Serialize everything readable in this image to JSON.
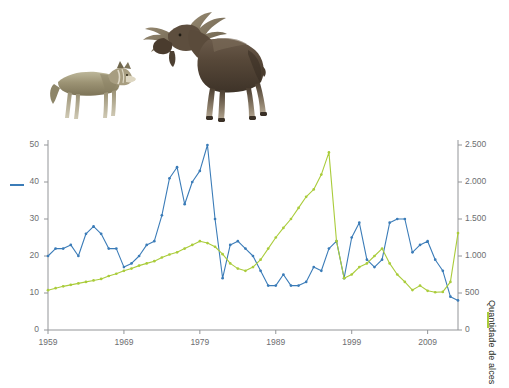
{
  "figure": {
    "wolf_label": "wolf-illustration",
    "moose_label": "moose-illustration",
    "caption": ""
  },
  "legend": {
    "wolf_marker": "blue-line-swatch",
    "moose_marker": "green-line-swatch"
  },
  "colors": {
    "wolf_line": "#3b7cb8",
    "moose_line": "#aacc3b",
    "axis": "#939598",
    "tick_text": "#6d6e71",
    "title_text": "#231f20"
  },
  "chart_data": {
    "type": "line",
    "title": "",
    "subtitle": "",
    "xlabel": "",
    "ylabel": "Quantidade de lobos",
    "y2label": "Quantidade de alces",
    "grid": false,
    "legend_position": "axis-titles",
    "xlim": [
      1959,
      2013
    ],
    "ylim": [
      0,
      50
    ],
    "y2lim": [
      0,
      2500
    ],
    "xticks": [
      1959,
      1969,
      1979,
      1989,
      1999,
      2009
    ],
    "xticklabels": [
      "1959",
      "1969",
      "1979",
      "1989",
      "1999",
      "2009"
    ],
    "yticks": [
      0,
      10,
      20,
      30,
      40,
      50
    ],
    "yticklabels": [
      "0",
      "10",
      "20",
      "30",
      "40",
      "50"
    ],
    "y2ticks": [
      0,
      500,
      1000,
      1500,
      2000,
      2500
    ],
    "y2ticklabels": [
      "0",
      "500",
      "1.000",
      "1.500",
      "2.000",
      "2.500"
    ],
    "x": [
      1959,
      1960,
      1961,
      1962,
      1963,
      1964,
      1965,
      1966,
      1967,
      1968,
      1969,
      1970,
      1971,
      1972,
      1973,
      1974,
      1975,
      1976,
      1977,
      1978,
      1979,
      1980,
      1981,
      1982,
      1983,
      1984,
      1985,
      1986,
      1987,
      1988,
      1989,
      1990,
      1991,
      1992,
      1993,
      1994,
      1995,
      1996,
      1997,
      1998,
      1999,
      2000,
      2001,
      2002,
      2003,
      2004,
      2005,
      2006,
      2007,
      2008,
      2009,
      2010,
      2011,
      2012,
      2013
    ],
    "series": [
      {
        "name": "Quantidade de lobos",
        "axis": "left",
        "color": "#3b7cb8",
        "values": [
          20,
          22,
          22,
          23,
          20,
          26,
          28,
          26,
          22,
          22,
          17,
          18,
          20,
          23,
          24,
          31,
          41,
          44,
          34,
          40,
          43,
          50,
          30,
          14,
          23,
          24,
          22,
          20,
          16,
          12,
          12,
          15,
          12,
          12,
          13,
          17,
          16,
          22,
          24,
          14,
          25,
          29,
          19,
          17,
          19,
          29,
          30,
          30,
          21,
          23,
          24,
          19,
          16,
          9,
          8
        ]
      },
      {
        "name": "Quantidade de alces",
        "axis": "right",
        "color": "#aacc3b",
        "values": [
          538,
          565,
          590,
          610,
          630,
          650,
          670,
          690,
          730,
          760,
          800,
          830,
          870,
          900,
          930,
          980,
          1020,
          1050,
          1100,
          1150,
          1200,
          1175,
          1125,
          1025,
          900,
          830,
          800,
          850,
          950,
          1100,
          1250,
          1380,
          1500,
          1650,
          1800,
          1900,
          2100,
          2400,
          1200,
          700,
          750,
          850,
          900,
          1000,
          1100,
          900,
          750,
          650,
          540,
          600,
          530,
          510,
          515,
          650,
          1310
        ]
      }
    ]
  },
  "axes": {
    "left_title": "Quantidade de lobos",
    "right_title": "Quantidade de alces"
  }
}
